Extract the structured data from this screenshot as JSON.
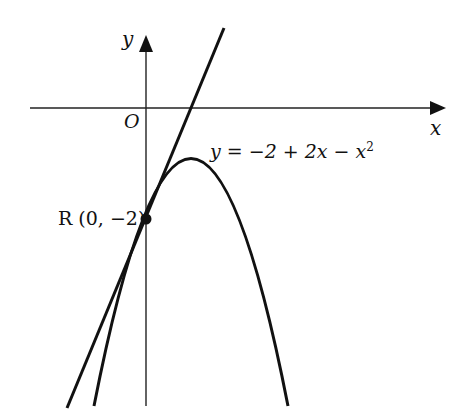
{
  "diagram": {
    "axis_labels": {
      "x": "x",
      "y": "y",
      "origin": "O"
    },
    "curve_label": {
      "prefix": "y = −2 + 2x − x",
      "superscript": "2"
    },
    "point_label": "R (0, −2)",
    "colors": {
      "stroke": "#111111",
      "background": "#ffffff"
    }
  }
}
